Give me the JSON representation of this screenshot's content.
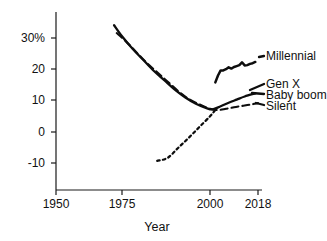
{
  "chart_data": {
    "type": "line",
    "title": "",
    "xlabel": "Year",
    "ylabel": "",
    "grid": false,
    "legend_position": "right-inline",
    "xlim": [
      1950,
      2018
    ],
    "ylim": [
      -15,
      37
    ],
    "x_ticks": [
      1950,
      1975,
      2000,
      2018
    ],
    "x_tick_labels": [
      "1950",
      "1975",
      "2000",
      "2018"
    ],
    "y_ticks": [
      -10,
      0,
      10,
      20,
      30
    ],
    "y_tick_labels": [
      "-10",
      "0",
      "10",
      "20",
      "30%"
    ],
    "series": [
      {
        "name": "Baby boom",
        "style": "solid",
        "x": [
          1972,
          1975,
          1978,
          1981,
          1984,
          1987,
          1990,
          1993,
          1996,
          1999,
          2001,
          2004,
          2007,
          2010,
          2013,
          2017
        ],
        "values": [
          34.0,
          30.5,
          26.5,
          23.0,
          19.5,
          16.5,
          13.5,
          11.0,
          9.0,
          7.6,
          7.2,
          8.2,
          9.3,
          10.3,
          11.3,
          12.3
        ]
      },
      {
        "name": "Silent",
        "style": "dashed",
        "x": [
          1973,
          1976,
          1979,
          1982,
          1985,
          1988,
          1991,
          1994,
          1997,
          2000,
          2003,
          2006,
          2009,
          2012,
          2015,
          2018
        ],
        "values": [
          31.5,
          29.0,
          25.5,
          22.0,
          19.0,
          16.0,
          13.0,
          10.5,
          8.8,
          7.4,
          7.0,
          7.4,
          7.9,
          8.3,
          8.7,
          9.2
        ]
      },
      {
        "name": "Gen X",
        "style": "dotted",
        "x": [
          1985,
          1988,
          1991,
          1994,
          1997,
          2000,
          2002
        ],
        "values": [
          -9.2,
          -8.2,
          -5.0,
          -1.8,
          1.6,
          5.0,
          7.0
        ]
      },
      {
        "name": "Millennial",
        "style": "solid-wiggle",
        "x": [
          2002,
          2003,
          2004,
          2005,
          2006,
          2007,
          2008,
          2009,
          2010,
          2011,
          2012,
          2013,
          2014,
          2015,
          2016,
          2017
        ],
        "values": [
          15.8,
          18.0,
          19.6,
          19.6,
          20.0,
          20.6,
          20.2,
          20.7,
          21.0,
          21.3,
          22.2,
          21.2,
          21.3,
          21.7,
          21.9,
          22.3
        ]
      }
    ],
    "series_labels": [
      {
        "name": "Millennial",
        "label": "Millennial"
      },
      {
        "name": "Gen X",
        "label": "Gen X"
      },
      {
        "name": "Baby boom",
        "label": "Baby boom"
      },
      {
        "name": "Silent",
        "label": "Silent"
      }
    ],
    "colors": {
      "line": "#0d0d0d",
      "axis": "#1a1a1a",
      "text": "#111111",
      "background": "#ffffff"
    }
  }
}
